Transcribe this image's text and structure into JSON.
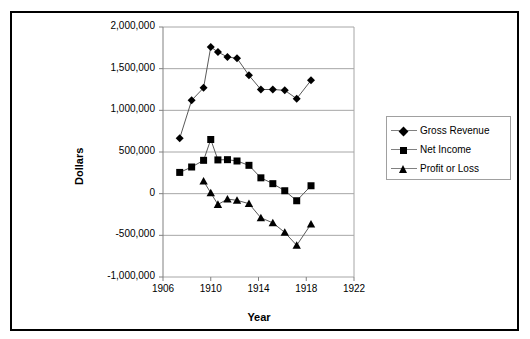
{
  "chart_data": {
    "type": "line",
    "title": "",
    "xlabel": "Year",
    "ylabel": "Dollars",
    "xlim": [
      1906,
      1922
    ],
    "ylim": [
      -1000000,
      2000000
    ],
    "xticks": [
      "1906",
      "1910",
      "1914",
      "1918",
      "1922"
    ],
    "xtick_values": [
      1906,
      1910,
      1914,
      1918,
      1922
    ],
    "yticks": [
      "2,000,000",
      "1,500,000",
      "1,000,000",
      "500,000",
      "0",
      "-500,000",
      "-1,000,000"
    ],
    "ytick_values": [
      2000000,
      1500000,
      1000000,
      500000,
      0,
      -500000,
      -1000000
    ],
    "grid": "horizontal",
    "legend_position": "right",
    "x": [
      1907.4,
      1908.0,
      1909.0,
      1910.0,
      1910.5,
      1911.2,
      1912.0,
      1913.0,
      1914.0,
      1915.0,
      1916.0,
      1917.0,
      1918.0,
      1919.4
    ],
    "series": [
      {
        "name": "Gross Revenue",
        "marker": "diamond",
        "color": "#000000",
        "x": [
          1907.4,
          1908.4,
          1909.4,
          1910.0,
          1910.6,
          1911.4,
          1912.2,
          1913.2,
          1914.2,
          1915.2,
          1916.2,
          1917.2,
          1918.4
        ],
        "values": [
          665000,
          1120000,
          1270000,
          1760000,
          1700000,
          1640000,
          1625000,
          1420000,
          1250000,
          1250000,
          1240000,
          1140000,
          1360000
        ]
      },
      {
        "name": "Net Income",
        "marker": "square",
        "color": "#000000",
        "x": [
          1907.4,
          1908.4,
          1909.4,
          1910.0,
          1910.6,
          1911.4,
          1912.2,
          1913.2,
          1914.2,
          1915.2,
          1916.2,
          1917.2,
          1918.4
        ],
        "values": [
          255000,
          320000,
          400000,
          650000,
          405000,
          408000,
          392000,
          340000,
          190000,
          120000,
          35000,
          -85000,
          95000
        ]
      },
      {
        "name": "Profit or Loss",
        "marker": "triangle",
        "color": "#000000",
        "x": [
          1909.4,
          1910.0,
          1910.6,
          1911.4,
          1912.2,
          1913.2,
          1914.2,
          1915.2,
          1916.2,
          1917.2,
          1918.4
        ],
        "values": [
          150000,
          10000,
          -130000,
          -65000,
          -80000,
          -120000,
          -290000,
          -350000,
          -465000,
          -620000,
          -365000
        ]
      }
    ]
  },
  "legend": {
    "items": [
      {
        "label": "Gross Revenue"
      },
      {
        "label": "Net Income"
      },
      {
        "label": "Profit or Loss"
      }
    ]
  },
  "axes": {
    "x_title": "Year",
    "y_title": "Dollars"
  }
}
